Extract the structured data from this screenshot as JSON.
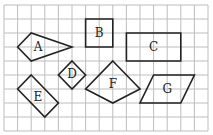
{
  "diagram": {
    "title": "Shapes on a square grid",
    "grid": {
      "cols": 15,
      "rows": 9,
      "origin_x": 4,
      "origin_y": 5,
      "cell_w": 13.6,
      "cell_h": 14,
      "line_color": "#bdbdbd"
    },
    "stroke_color": "#222222",
    "shapes": [
      {
        "id": "A",
        "label": "A",
        "kind": "kite",
        "points": [
          [
            1,
            3
          ],
          [
            2,
            2
          ],
          [
            5,
            3
          ],
          [
            2,
            4
          ]
        ],
        "label_pos": [
          2.5,
          3
        ]
      },
      {
        "id": "B",
        "label": "B",
        "kind": "square",
        "points": [
          [
            6,
            1
          ],
          [
            8,
            1
          ],
          [
            8,
            3
          ],
          [
            6,
            3
          ]
        ],
        "label_pos": [
          7,
          2
        ]
      },
      {
        "id": "C",
        "label": "C",
        "kind": "rectangle",
        "points": [
          [
            9,
            2
          ],
          [
            13,
            2
          ],
          [
            13,
            4
          ],
          [
            9,
            4
          ]
        ],
        "label_pos": [
          11,
          3
        ]
      },
      {
        "id": "D",
        "label": "D",
        "kind": "square (rotated)",
        "points": [
          [
            5,
            4
          ],
          [
            6,
            5
          ],
          [
            5,
            6
          ],
          [
            4,
            5
          ]
        ],
        "label_pos": [
          5,
          4.95
        ]
      },
      {
        "id": "E",
        "label": "E",
        "kind": "rectangle (rotated)",
        "points": [
          [
            2,
            5
          ],
          [
            4,
            7
          ],
          [
            3,
            8
          ],
          [
            1,
            6
          ]
        ],
        "label_pos": [
          2.5,
          6.6
        ]
      },
      {
        "id": "F",
        "label": "F",
        "kind": "kite",
        "points": [
          [
            8,
            4
          ],
          [
            10,
            6
          ],
          [
            8,
            7
          ],
          [
            6,
            6
          ]
        ],
        "label_pos": [
          8,
          5.65
        ]
      },
      {
        "id": "G",
        "label": "G",
        "kind": "parallelogram",
        "points": [
          [
            11,
            5
          ],
          [
            14,
            5
          ],
          [
            13,
            7
          ],
          [
            10,
            7
          ]
        ],
        "label_pos": [
          12,
          6
        ]
      }
    ]
  }
}
